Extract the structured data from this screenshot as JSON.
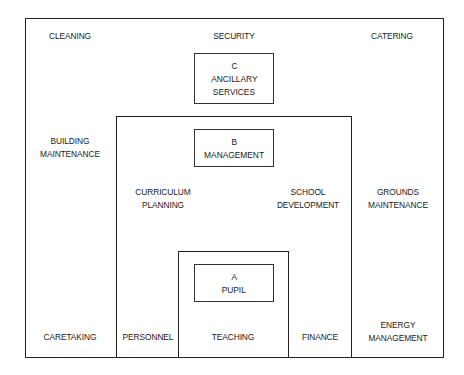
{
  "diagram": {
    "outer_zone": {
      "key": "C",
      "title": "ANCILLARY SERVICES",
      "items": {
        "cleaning": "CLEANING",
        "security": "SECURITY",
        "catering": "CATERING",
        "building_maintenance_1": "BUILDING",
        "building_maintenance_2": "MAINTENANCE",
        "grounds_maintenance_1": "GROUNDS",
        "grounds_maintenance_2": "MAINTENANCE",
        "caretaking": "CARETAKING",
        "energy_management_1": "ENERGY",
        "energy_management_2": "MANAGEMENT"
      }
    },
    "middle_zone": {
      "key": "B",
      "title": "MANAGEMENT",
      "items": {
        "curriculum_planning_1": "CURRICULUM",
        "curriculum_planning_2": "PLANNING",
        "school_development_1": "SCHOOL",
        "school_development_2": "DEVELOPMENT",
        "personnel": "PERSONNEL",
        "finance": "FINANCE"
      }
    },
    "inner_zone": {
      "key": "A",
      "title": "PUPIL",
      "items": {
        "teaching": "TEACHING"
      }
    },
    "c_label": {
      "line1": "C",
      "line2": "ANCILLARY",
      "line3": "SERVICES"
    },
    "b_label": {
      "line1": "B",
      "line2": "MANAGEMENT"
    },
    "a_label": {
      "line1": "A",
      "line2": "PUPIL"
    }
  }
}
